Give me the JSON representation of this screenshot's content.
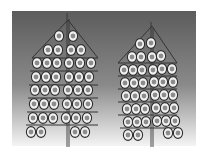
{
  "image": {
    "width": 208,
    "height": 156,
    "description": "Two stylized trees made of circular beads on a gray gradient background"
  },
  "panel": {
    "x": 12,
    "y": 11,
    "w": 184,
    "h": 135,
    "color_top": "#5c5c5c",
    "color_mid": "#8a8a8a",
    "color_bottom": "#f4f4f4"
  },
  "colors": {
    "outline": "#2e2e2e",
    "bead_ring": "#f2f2f2",
    "bead_center": "#8c8c8c",
    "line": "#333333"
  },
  "trees": [
    {
      "name": "left-tree",
      "trunk": {
        "x": 68,
        "y1": 13,
        "y2": 147
      },
      "roof": {
        "apex": [
          68,
          20
        ],
        "left": [
          32,
          58
        ],
        "right": [
          98,
          58
        ]
      },
      "shelves": [
        {
          "y": 58,
          "x1": 32,
          "x2": 98
        },
        {
          "y": 71,
          "x1": 30,
          "x2": 98
        },
        {
          "y": 85,
          "x1": 29,
          "x2": 98
        },
        {
          "y": 98,
          "x1": 28,
          "x2": 98
        },
        {
          "y": 112,
          "x1": 27,
          "x2": 98
        },
        {
          "y": 125,
          "x1": 26,
          "x2": 98
        }
      ],
      "beads": [
        [
          59,
          36
        ],
        [
          73,
          36
        ],
        [
          48,
          50
        ],
        [
          58,
          50
        ],
        [
          71,
          50
        ],
        [
          81,
          50
        ],
        [
          37,
          63
        ],
        [
          47,
          63
        ],
        [
          57,
          63
        ],
        [
          69,
          63
        ],
        [
          80,
          63
        ],
        [
          91,
          63
        ],
        [
          36,
          77
        ],
        [
          46,
          77
        ],
        [
          56,
          77
        ],
        [
          69,
          77
        ],
        [
          79,
          77
        ],
        [
          89,
          77
        ],
        [
          35,
          90
        ],
        [
          45,
          90
        ],
        [
          55,
          90
        ],
        [
          68,
          90
        ],
        [
          78,
          90
        ],
        [
          88,
          90
        ],
        [
          34,
          104
        ],
        [
          44,
          104
        ],
        [
          54,
          104
        ],
        [
          67,
          104
        ],
        [
          77,
          104
        ],
        [
          88,
          104
        ],
        [
          33,
          118
        ],
        [
          43,
          118
        ],
        [
          53,
          118
        ],
        [
          66,
          118
        ],
        [
          76,
          118
        ],
        [
          87,
          118
        ],
        [
          31,
          132
        ],
        [
          41,
          132
        ],
        [
          75,
          132
        ],
        [
          85,
          132
        ]
      ]
    },
    {
      "name": "right-tree",
      "trunk": {
        "x": 152,
        "y1": 22,
        "y2": 147
      },
      "roof": {
        "apex": [
          152,
          26
        ],
        "left": [
          118,
          63
        ],
        "right": [
          177,
          63
        ]
      },
      "shelves": [
        {
          "y": 63,
          "x1": 118,
          "x2": 177
        },
        {
          "y": 76,
          "x1": 118,
          "x2": 177
        },
        {
          "y": 89,
          "x1": 118,
          "x2": 177
        },
        {
          "y": 102,
          "x1": 118,
          "x2": 177
        },
        {
          "y": 115,
          "x1": 118,
          "x2": 177
        },
        {
          "y": 128,
          "x1": 120,
          "x2": 177
        }
      ],
      "beads": [
        [
          140,
          44
        ],
        [
          151,
          43
        ],
        [
          132,
          57
        ],
        [
          141,
          57
        ],
        [
          152,
          57
        ],
        [
          161,
          56
        ],
        [
          124,
          70
        ],
        [
          133,
          70
        ],
        [
          142,
          70
        ],
        [
          153,
          70
        ],
        [
          162,
          69
        ],
        [
          172,
          69
        ],
        [
          125,
          83
        ],
        [
          134,
          83
        ],
        [
          143,
          83
        ],
        [
          154,
          82
        ],
        [
          163,
          82
        ],
        [
          173,
          82
        ],
        [
          126,
          96
        ],
        [
          135,
          96
        ],
        [
          144,
          96
        ],
        [
          155,
          95
        ],
        [
          164,
          95
        ],
        [
          173,
          95
        ],
        [
          127,
          109
        ],
        [
          136,
          109
        ],
        [
          145,
          109
        ],
        [
          156,
          108
        ],
        [
          165,
          108
        ],
        [
          174,
          108
        ],
        [
          128,
          122
        ],
        [
          137,
          122
        ],
        [
          146,
          122
        ],
        [
          157,
          121
        ],
        [
          166,
          121
        ],
        [
          175,
          121
        ],
        [
          128,
          135
        ],
        [
          138,
          135
        ],
        [
          168,
          133
        ],
        [
          178,
          133
        ]
      ]
    }
  ]
}
